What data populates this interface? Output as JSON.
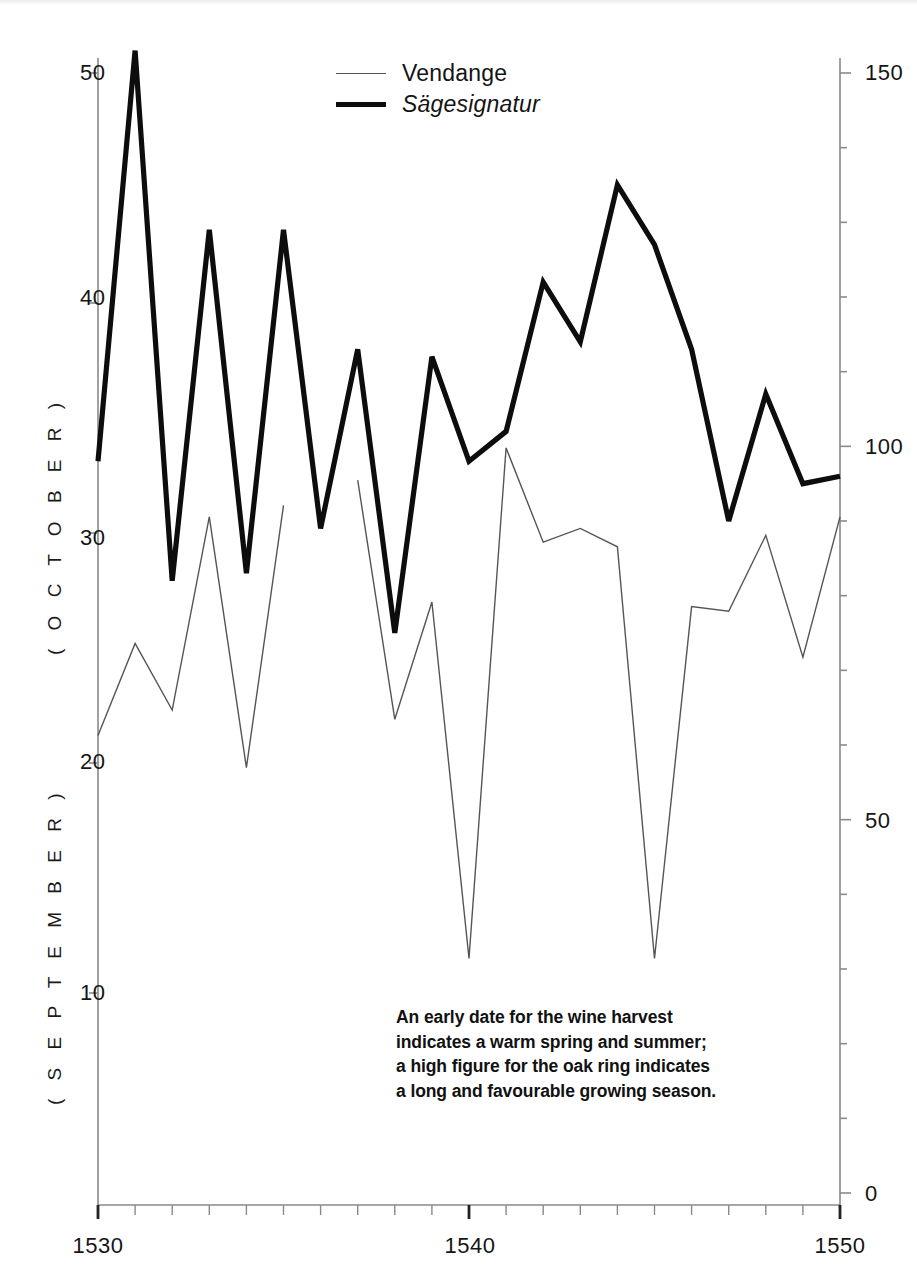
{
  "legend": {
    "items": [
      {
        "label": "Vendange",
        "style": "thin",
        "italic": false
      },
      {
        "label": "Sägesignatur",
        "style": "thick",
        "italic": true
      }
    ]
  },
  "axes": {
    "left_title": "( O C T O B E R )",
    "left_title_lower": "( S E P T E M B E R )",
    "left_ticks": [
      "50",
      "40",
      "30",
      "20",
      "10"
    ],
    "right_ticks": [
      "150",
      "100",
      "50",
      "0"
    ],
    "x_ticks": [
      "1530",
      "1540",
      "1550"
    ]
  },
  "annotation": {
    "line1": "An early date for the wine harvest",
    "line2": "indicates a warm spring and summer;",
    "line3": "a high figure for the oak ring indicates",
    "line4": "a long and favourable growing season."
  },
  "colors": {
    "vendange_line": "#555555",
    "sagesignatur_line": "#0d0d0d",
    "axis": "#8a8a8a",
    "text": "#151515",
    "background": "#ffffff"
  },
  "chart_data": {
    "type": "line",
    "title": "",
    "xlabel": "",
    "ylabel": "( O C T O B E R ) / ( S E P T E M B E R )",
    "y2label": "",
    "grid": false,
    "legend_position": "top-center",
    "xlim": [
      1530,
      1550
    ],
    "ylim": [
      1,
      54
    ],
    "y2lim": [
      0,
      153
    ],
    "x": [
      1530,
      1531,
      1532,
      1533,
      1534,
      1535,
      1536,
      1537,
      1538,
      1539,
      1540,
      1541,
      1542,
      1543,
      1544,
      1545,
      1546,
      1547,
      1548,
      1549,
      1550
    ],
    "series": [
      {
        "name": "Vendange",
        "axis": "left",
        "unit": "day (Sept/Oct date of wine harvest)",
        "values": [
          21.2,
          25.2,
          22.3,
          30.7,
          19.8,
          31.2,
          null,
          32.3,
          21.9,
          27.0,
          11.5,
          33.7,
          29.6,
          30.2,
          29.4,
          11.5,
          26.8,
          26.6,
          29.9,
          24.6,
          30.7
        ]
      },
      {
        "name": "Sägesignatur",
        "axis": "right",
        "unit": "oak ring index",
        "values": [
          98,
          153,
          82,
          129,
          83,
          129,
          89,
          113,
          75,
          112,
          98,
          102,
          122,
          114,
          135,
          127,
          113,
          90,
          107,
          95,
          96
        ]
      }
    ],
    "annotations": [
      "An early date for the wine harvest indicates a warm spring and summer; a high figure for the oak ring indicates a long and favourable growing season."
    ]
  }
}
